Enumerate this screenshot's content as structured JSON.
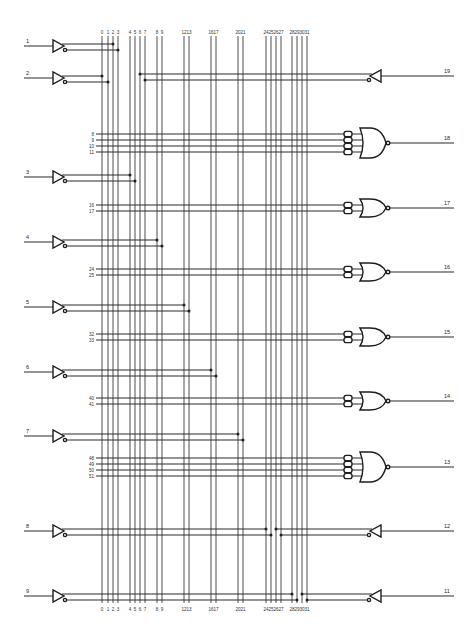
{
  "diagram": {
    "title": "",
    "colors": {
      "ink": "#1e1e1e",
      "background": "#ffffff"
    },
    "columns": [
      {
        "n": "0",
        "x": 102
      },
      {
        "n": "1",
        "x": 108
      },
      {
        "n": "2",
        "x": 113
      },
      {
        "n": "3",
        "x": 118
      },
      {
        "n": "4",
        "x": 130
      },
      {
        "n": "5",
        "x": 135
      },
      {
        "n": "6",
        "x": 140
      },
      {
        "n": "7",
        "x": 145
      },
      {
        "n": "8",
        "x": 157
      },
      {
        "n": "9",
        "x": 162
      },
      {
        "n": "12",
        "x": 184
      },
      {
        "n": "13",
        "x": 189
      },
      {
        "n": "16",
        "x": 211
      },
      {
        "n": "17",
        "x": 216
      },
      {
        "n": "20",
        "x": 238
      },
      {
        "n": "21",
        "x": 243
      },
      {
        "n": "24",
        "x": 266
      },
      {
        "n": "25",
        "x": 271
      },
      {
        "n": "26",
        "x": 276
      },
      {
        "n": "27",
        "x": 281
      },
      {
        "n": "28",
        "x": 292
      },
      {
        "n": "29",
        "x": 297
      },
      {
        "n": "30",
        "x": 302
      },
      {
        "n": "31",
        "x": 307
      }
    ],
    "column_top_y": 36,
    "column_bottom_y": 603,
    "top_label_y": 34,
    "bottom_label_y": 611,
    "inputs": [
      {
        "pin": "1",
        "y": 46,
        "dots": [
          113,
          118
        ]
      },
      {
        "pin": "2",
        "y": 78,
        "dots": [
          102,
          108
        ]
      },
      {
        "pin": "3",
        "y": 177,
        "dots": [
          130,
          135
        ]
      },
      {
        "pin": "4",
        "y": 242,
        "dots": [
          157,
          162
        ]
      },
      {
        "pin": "5",
        "y": 307,
        "dots": [
          184,
          189
        ]
      },
      {
        "pin": "6",
        "y": 372,
        "dots": [
          211,
          216
        ]
      },
      {
        "pin": "7",
        "y": 436,
        "dots": [
          238,
          243
        ]
      },
      {
        "pin": "8",
        "y": 531,
        "dots": [
          266,
          271
        ]
      },
      {
        "pin": "9",
        "y": 596,
        "dots": [
          292,
          297
        ]
      }
    ],
    "io_buffers": [
      {
        "pin": "19",
        "y": 76,
        "dots": [
          140,
          145
        ]
      },
      {
        "pin": "12",
        "y": 531,
        "dots": [
          276,
          281
        ]
      },
      {
        "pin": "11",
        "y": 596,
        "dots": [
          302,
          307
        ]
      }
    ],
    "or_gates": [
      {
        "pin": "18",
        "y": 143,
        "terms": [
          {
            "n": "8",
            "y": 134
          },
          {
            "n": "9",
            "y": 140
          },
          {
            "n": "10",
            "y": 146
          },
          {
            "n": "11",
            "y": 152
          }
        ]
      },
      {
        "pin": "17",
        "y": 208,
        "terms": [
          {
            "n": "16",
            "y": 205
          },
          {
            "n": "17",
            "y": 211
          }
        ]
      },
      {
        "pin": "16",
        "y": 272,
        "terms": [
          {
            "n": "24",
            "y": 269
          },
          {
            "n": "25",
            "y": 275
          }
        ]
      },
      {
        "pin": "15",
        "y": 337,
        "terms": [
          {
            "n": "32",
            "y": 334
          },
          {
            "n": "33",
            "y": 340
          }
        ]
      },
      {
        "pin": "14",
        "y": 401,
        "terms": [
          {
            "n": "40",
            "y": 398
          },
          {
            "n": "41",
            "y": 404
          }
        ]
      },
      {
        "pin": "13",
        "y": 467,
        "terms": [
          {
            "n": "48",
            "y": 458
          },
          {
            "n": "49",
            "y": 464
          },
          {
            "n": "50",
            "y": 470
          },
          {
            "n": "51",
            "y": 476
          }
        ]
      }
    ]
  }
}
